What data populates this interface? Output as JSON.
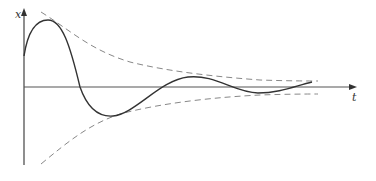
{
  "diagram": {
    "type": "damped-oscillation",
    "axes": {
      "x_label": "t",
      "y_label": "x"
    },
    "curves": [
      {
        "name": "damped-oscillation",
        "style": "solid",
        "color": "#333333"
      },
      {
        "name": "upper-envelope",
        "style": "dashed",
        "color": "#888888"
      },
      {
        "name": "lower-envelope",
        "style": "dashed",
        "color": "#888888"
      }
    ]
  }
}
